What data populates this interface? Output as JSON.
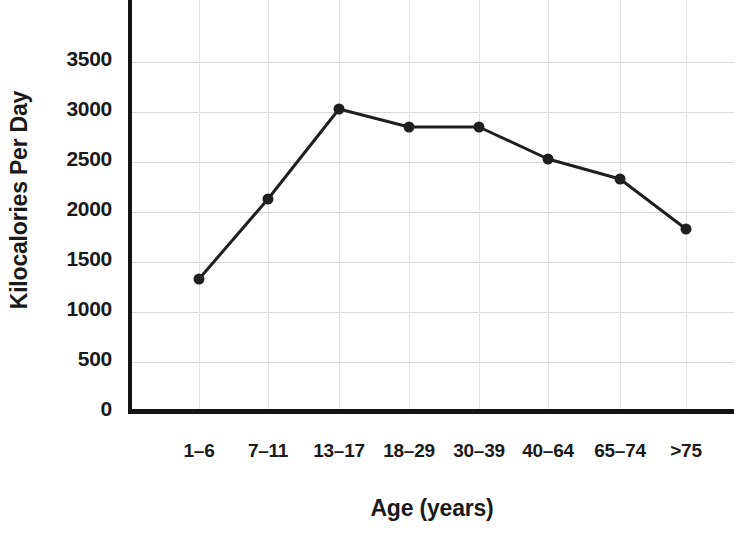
{
  "chart_data": {
    "type": "line",
    "title": "",
    "xlabel": "Age (years)",
    "ylabel": "Kilocalories Per Day",
    "categories": [
      "1–6",
      "7–11",
      "13–17",
      "18–29",
      "30–39",
      "40–64",
      "65–74",
      ">75"
    ],
    "values": [
      1300,
      2100,
      3000,
      2820,
      2820,
      2500,
      2300,
      1800
    ],
    "series": [
      {
        "name": "Kilocalories Per Day",
        "values": [
          1300,
          2100,
          3000,
          2820,
          2820,
          2500,
          2300,
          1800
        ]
      }
    ],
    "ylim": [
      0,
      3800
    ],
    "yticks": [
      0,
      500,
      1000,
      1500,
      2000,
      2500,
      3000,
      3500
    ],
    "ytick_labels": [
      "0",
      "500",
      "1000",
      "1500",
      "2000",
      "2500",
      "3000",
      "3500"
    ],
    "grid": true,
    "grid_axis": "both",
    "legend": false,
    "legend_position": "none",
    "marker": "circle",
    "marker_color": "#1f1f1f",
    "line_color": "#1f1f1f",
    "line_width": 3,
    "gridline_color": "#d8d8dc",
    "axis_color": "#141414",
    "text_color": "#1a1a1a",
    "background_color": "#ffffff",
    "point_pixel_x": [
      199,
      268,
      339,
      409,
      479,
      548,
      620,
      686
    ],
    "vertical_gridline_values": [
      "1–6",
      "7–11",
      "13–17",
      "18–29",
      "30–39",
      "40–64",
      "65–74",
      ">75"
    ]
  }
}
